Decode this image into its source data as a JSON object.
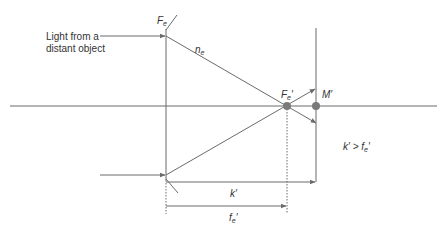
{
  "diagram": {
    "caption_light": [
      "Light from a",
      "distant object"
    ],
    "lens_label": "F",
    "lens_label_sub": "e",
    "index_label": "n",
    "index_label_sub": "e",
    "focal_point_label": "F",
    "focal_point_sub": "e",
    "focal_point_prime": "′",
    "image_point_label": "M′",
    "distance_k_label": "k′",
    "distance_f_label": "f",
    "distance_f_sub": "e",
    "distance_f_prime": "′",
    "condition_text_k": "k′ > f",
    "condition_text_sub": "e",
    "condition_text_prime": "′",
    "line_color": "#6b6b6b",
    "dot_color": "#7a7a7a"
  }
}
